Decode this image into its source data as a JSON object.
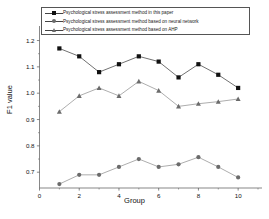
{
  "chart_data": {
    "type": "line",
    "title": "",
    "xlabel": "Group",
    "ylabel": "F1 value",
    "x": [
      1,
      2,
      3,
      4,
      5,
      6,
      7,
      8,
      9,
      10
    ],
    "xlim": [
      0,
      11
    ],
    "ylim": [
      0.64,
      1.24
    ],
    "xticks": [
      0,
      2,
      4,
      6,
      8,
      10
    ],
    "yticks": [
      0.7,
      0.8,
      0.9,
      1.0,
      1.1,
      1.2
    ],
    "xtick_labels": [
      "0",
      "2",
      "4",
      "6",
      "8",
      "10"
    ],
    "ytick_labels": [
      "0.7",
      "0.8",
      "0.9",
      "1.0",
      "1.1",
      "1.2"
    ],
    "grid": false,
    "legend_position": "top",
    "series": [
      {
        "name": "Psychological stress assessment method in this paper",
        "marker": "square",
        "color": "#111111",
        "values": [
          1.17,
          1.14,
          1.08,
          1.11,
          1.14,
          1.12,
          1.06,
          1.11,
          1.07,
          1.02
        ]
      },
      {
        "name": "Psychological stress assessment method based on neural network",
        "marker": "circle",
        "color": "#6b6b6b",
        "values": [
          0.655,
          0.69,
          0.69,
          0.72,
          0.75,
          0.72,
          0.73,
          0.757,
          0.72,
          0.68
        ]
      },
      {
        "name": "Psychological stress assessment method based on AHP",
        "marker": "triangle",
        "color": "#6b6b6b",
        "values": [
          0.93,
          0.99,
          1.02,
          0.99,
          1.045,
          1.01,
          0.95,
          0.96,
          0.968,
          0.978
        ]
      }
    ]
  },
  "legend": {
    "items": [
      {
        "label": "Psychological stress assessment method in this paper",
        "marker": "square-marker-icon"
      },
      {
        "label": "Psychological stress assessment method based on neural network",
        "marker": "circle-marker-icon"
      },
      {
        "label": "Psychological stress assessment method based on AHP",
        "marker": "triangle-marker-icon"
      }
    ]
  },
  "axes": {
    "x_title": "Group",
    "y_title": "F1 value"
  }
}
